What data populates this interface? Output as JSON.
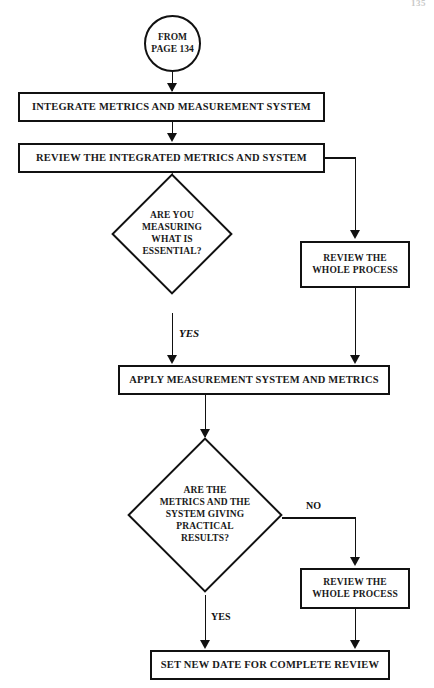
{
  "page": {
    "page_number": "135",
    "width": 434,
    "height": 688,
    "background_color": "#ffffff",
    "ink_color": "#111111"
  },
  "flowchart": {
    "title": "Metrics and Measurement System Review Flow",
    "nodes": {
      "connector_from_page": {
        "type": "connector-circle",
        "line1": "FROM",
        "line2": "PAGE 134"
      },
      "integrate": {
        "type": "process",
        "label": "INTEGRATE METRICS AND MEASUREMENT SYSTEM"
      },
      "review_integrated": {
        "type": "process",
        "label": "REVIEW THE  INTEGRATED METRICS AND SYSTEM"
      },
      "decision_essential": {
        "type": "decision",
        "line1": "ARE YOU",
        "line2": "MEASURING",
        "line3": "WHAT IS",
        "line4": "ESSENTIAL?"
      },
      "review_whole_process_1": {
        "type": "process",
        "line1": "REVIEW THE",
        "line2": "WHOLE PROCESS"
      },
      "apply": {
        "type": "process",
        "label": "APPLY MEASUREMENT SYSTEM AND METRICS"
      },
      "decision_practical": {
        "type": "decision",
        "line1": "ARE THE",
        "line2": "METRICS AND THE",
        "line3": "SYSTEM GIVING",
        "line4": "PRACTICAL",
        "line5": "RESULTS?"
      },
      "review_whole_process_2": {
        "type": "process",
        "line1": "REVIEW THE",
        "line2": "WHOLE PROCESS"
      },
      "set_new_date": {
        "type": "process",
        "label": "SET NEW DATE FOR COMPLETE REVIEW"
      }
    },
    "edge_labels": {
      "essential_yes": "YES",
      "practical_no": "NO",
      "practical_yes": "YES"
    }
  }
}
